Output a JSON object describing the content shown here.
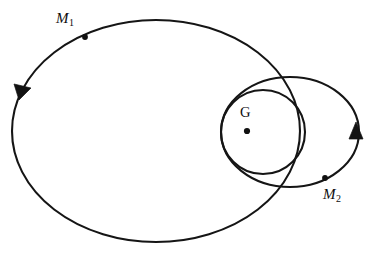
{
  "figure": {
    "kind": "two-body-orbit-diagram",
    "background_color": "#ffffff",
    "stroke_color": "#151515"
  },
  "labels": {
    "m1": {
      "symbol": "M",
      "subscript": "1"
    },
    "m2": {
      "symbol": "M",
      "subscript": "2"
    },
    "barycenter": {
      "text": "G"
    }
  },
  "chart_data": {
    "type": "scatter",
    "title": "",
    "xlabel": "",
    "ylabel": "",
    "grid": false,
    "legend": null,
    "xlim": [
      0,
      378
    ],
    "ylim": [
      0,
      257
    ],
    "curves": [
      {
        "name": "orbit-of-M1",
        "shape": "ellipse",
        "center": [
          156,
          131
        ],
        "rx": 144,
        "ry": 111,
        "closed": true
      },
      {
        "name": "orbit-of-M2",
        "shape": "ellipse",
        "center": [
          290,
          132
        ],
        "rx": 69,
        "ry": 55,
        "closed": true
      },
      {
        "name": "circle-around-barycenter",
        "shape": "circle",
        "center": [
          263,
          132
        ],
        "r": 42,
        "closed": true
      }
    ],
    "points": [
      {
        "name": "M1",
        "x": 85,
        "y": 37,
        "label": "M_1"
      },
      {
        "name": "M2",
        "x": 325,
        "y": 178,
        "label": "M_2"
      },
      {
        "name": "G",
        "x": 247,
        "y": 131,
        "label": "G"
      }
    ],
    "annotations": [
      {
        "name": "direction-arrow-M1-orbit",
        "x": 22,
        "y": 91,
        "angle_deg": 110,
        "meaning": "counterclockwise travel on M1 orbit"
      },
      {
        "name": "direction-arrow-M2-orbit",
        "x": 356,
        "y": 131,
        "angle_deg": -90,
        "meaning": "counterclockwise travel on M2 orbit"
      }
    ]
  }
}
